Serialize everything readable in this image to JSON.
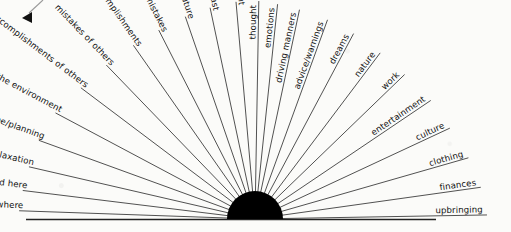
{
  "chart_data": {
    "type": "pie",
    "title": "",
    "subtitle": "",
    "xlabel": "",
    "ylabel": "",
    "legend": "none",
    "grid": false,
    "hub": {
      "shape": "filled-semicircle",
      "color": "#000000",
      "center_x": 255,
      "center_y": 219,
      "radius": 28
    },
    "axis_range_degrees": [
      0,
      180
    ],
    "sweep_direction": "left-to-right",
    "categories": [
      "upbringing",
      "finances",
      "clothing",
      "culture",
      "entertainment",
      "work",
      "nature",
      "dreams",
      "advice/warnings",
      "driving manners",
      "emotions",
      "thought",
      "present",
      "past",
      "future",
      "mistakes",
      "accomplishments",
      "mistakes of others",
      "accomplishments of others",
      "disturbances in the environment",
      "daily routine/planning",
      "relaxation",
      "not mentioned here",
      "see elsewhere"
    ],
    "values": [
      1,
      1,
      1,
      1,
      1,
      1,
      1,
      1,
      1,
      1,
      1,
      1,
      1,
      1,
      1,
      1,
      1,
      1,
      1,
      1,
      1,
      1,
      1,
      1
    ],
    "angles_degrees": [
      178,
      171,
      163,
      154,
      144,
      133,
      122,
      112,
      103,
      95,
      88,
      82,
      90,
      74,
      66,
      58,
      50,
      42,
      34,
      26,
      19,
      12,
      6,
      2
    ]
  },
  "diagram": {
    "spokes_left": [
      {
        "label": "upbringing",
        "angle": 179,
        "len": 232,
        "side": "left"
      },
      {
        "label": "finances",
        "angle": 172,
        "len": 228,
        "side": "left"
      },
      {
        "label": "clothing",
        "angle": 164,
        "len": 222,
        "side": "left"
      },
      {
        "label": "culture",
        "angle": 155,
        "len": 215,
        "side": "left"
      },
      {
        "label": "entertainment",
        "angle": 146,
        "len": 212,
        "side": "left"
      },
      {
        "label": "work",
        "angle": 136,
        "len": 208,
        "side": "left"
      },
      {
        "label": "nature",
        "angle": 127,
        "len": 208,
        "side": "left"
      },
      {
        "label": "dreams",
        "angle": 118,
        "len": 210,
        "side": "left"
      },
      {
        "label": "advice/warnings",
        "angle": 110,
        "len": 212,
        "side": "left"
      },
      {
        "label": "driving manners",
        "angle": 102,
        "len": 214,
        "side": "left"
      },
      {
        "label": "emotions",
        "angle": 96,
        "len": 216,
        "side": "left"
      },
      {
        "label": "thought",
        "angle": 91,
        "len": 218,
        "side": "left"
      }
    ],
    "spokes_right": [
      {
        "label": "present",
        "angle": 85,
        "len": 218,
        "side": "right"
      },
      {
        "label": "past",
        "angle": 78,
        "len": 216,
        "side": "right"
      },
      {
        "label": "future",
        "angle": 71,
        "len": 214,
        "side": "right"
      },
      {
        "label": "mistakes",
        "angle": 63,
        "len": 212,
        "side": "right"
      },
      {
        "label": "accomplishments",
        "angle": 55,
        "len": 212,
        "side": "right"
      },
      {
        "label": "mistakes of others",
        "angle": 46,
        "len": 214,
        "side": "right"
      },
      {
        "label": "accomplishments of others",
        "angle": 37,
        "len": 218,
        "side": "right"
      },
      {
        "label": "disturbances in the environment",
        "angle": 28,
        "len": 226,
        "side": "right"
      },
      {
        "label": "daily routine/planning",
        "angle": 20,
        "len": 230,
        "side": "right"
      },
      {
        "label": "relaxation",
        "angle": 13,
        "len": 232,
        "side": "right"
      },
      {
        "label": "not mentioned here",
        "angle": 7,
        "len": 234,
        "side": "right"
      },
      {
        "label": "see elsewhere",
        "angle": 2,
        "len": 236,
        "side": "right"
      }
    ],
    "baseline": {
      "x1": 26,
      "y1": 219.5,
      "x2": 436,
      "y2": 219.5
    },
    "pointer": {
      "name": "annotation-arrow",
      "x1": 43,
      "y1": 0,
      "x2": 23,
      "y2": 18,
      "head_x": 22,
      "head_y": 18
    }
  }
}
